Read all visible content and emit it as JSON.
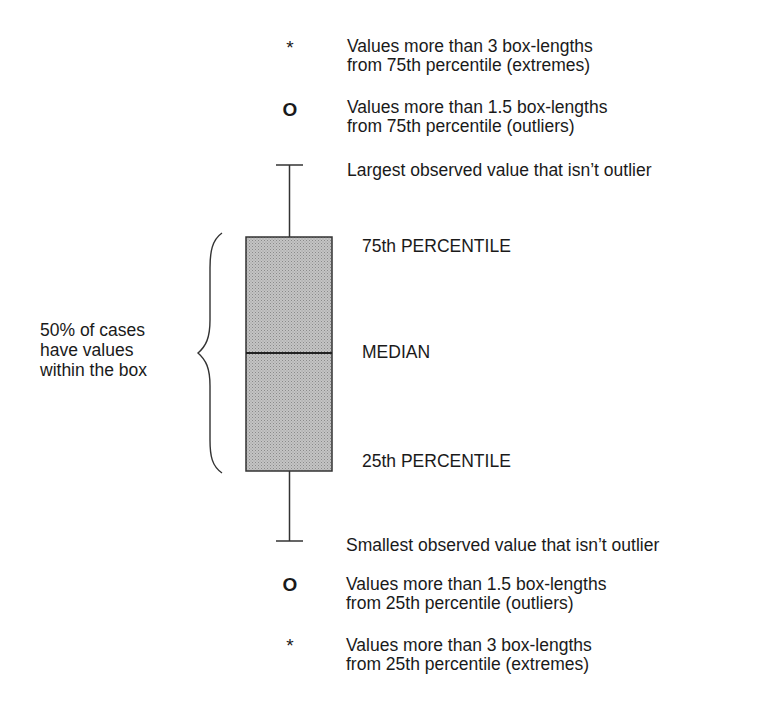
{
  "diagram": {
    "type": "boxplot-legend",
    "symbols": {
      "extreme": "*",
      "outlier": "O"
    },
    "upper": {
      "extreme_line1": "Values more than 3 box-lengths",
      "extreme_line2": "from 75th percentile (extremes)",
      "outlier_line1": "Values more than 1.5 box-lengths",
      "outlier_line2": "from 75th percentile (outliers)",
      "whisker_label": "Largest observed value that isn’t outlier"
    },
    "box": {
      "p75_label": "75th PERCENTILE",
      "median_label": "MEDIAN",
      "p25_label": "25th PERCENTILE",
      "brace_line1": "50% of cases",
      "brace_line2": "have values",
      "brace_line3": "within the box",
      "fill_color": "#b4b4b4",
      "stroke_color": "#333333"
    },
    "lower": {
      "whisker_label": "Smallest observed value that isn’t outlier",
      "outlier_line1": "Values more than 1.5 box-lengths",
      "outlier_line2": "from 25th percentile (outliers)",
      "extreme_line1": "Values more than 3 box-lengths",
      "extreme_line2": "from 25th percentile (extremes)"
    }
  }
}
